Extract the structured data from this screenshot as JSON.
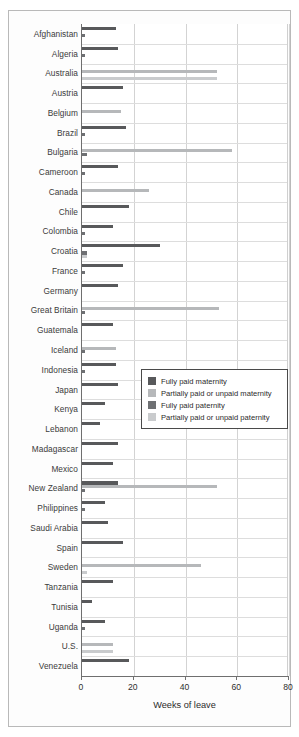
{
  "chart_data": {
    "type": "bar",
    "orientation": "horizontal",
    "title": "",
    "xlabel": "Weeks of leave",
    "ylabel": "",
    "xlim": [
      0,
      80
    ],
    "xticks": [
      0,
      20,
      40,
      60,
      80
    ],
    "xtick_labels": [
      "0",
      "20",
      "40",
      "60",
      "80"
    ],
    "grid": "vertical-and-horizontal",
    "legend_position": "center-right-inside",
    "categories": [
      "Afghanistan",
      "Algeria",
      "Australia",
      "Austria",
      "Belgium",
      "Brazil",
      "Bulgaria",
      "Cameroon",
      "Canada",
      "Chile",
      "Colombia",
      "Croatia",
      "France",
      "Germany",
      "Great Britain",
      "Guatemala",
      "Iceland",
      "Indonesia",
      "Japan",
      "Kenya",
      "Lebanon",
      "Madagascar",
      "Mexico",
      "New Zealand",
      "Philippines",
      "Saudi Arabia",
      "Spain",
      "Sweden",
      "Tanzania",
      "Tunisia",
      "Uganda",
      "U.S.",
      "Venezuela"
    ],
    "series": [
      {
        "name": "Fully paid maternity",
        "key": "fm",
        "color": "#58595b",
        "values": [
          13,
          14,
          0,
          16,
          0,
          17,
          0,
          14,
          0,
          18,
          12,
          30,
          16,
          14,
          0,
          12,
          0,
          13,
          14,
          9,
          7,
          14,
          12,
          14,
          9,
          10,
          16,
          0,
          12,
          4,
          9,
          0,
          18
        ]
      },
      {
        "name": "Partially paid or unpaid maternity",
        "key": "pm",
        "color": "#b6b8ba",
        "values": [
          0,
          0,
          52,
          0,
          15,
          0,
          58,
          0,
          26,
          0,
          0,
          0,
          0,
          0,
          53,
          0,
          13,
          0,
          0,
          0,
          0,
          0,
          0,
          52,
          0,
          0,
          0,
          46,
          0,
          0,
          0,
          12,
          0
        ]
      },
      {
        "name": "Fully paid paternity",
        "key": "fp",
        "color": "#6e7073",
        "values": [
          1,
          1,
          0,
          0,
          0,
          1,
          2,
          1,
          0,
          0,
          1,
          2,
          1,
          0,
          1,
          0,
          1,
          1,
          0,
          0,
          0,
          0,
          0,
          1,
          1,
          0,
          0,
          0,
          0,
          0,
          1,
          0,
          0
        ]
      },
      {
        "name": "Partially paid or unpaid paternity",
        "key": "pp",
        "color": "#c9cbcd",
        "values": [
          0,
          0,
          52,
          0,
          0,
          0,
          0,
          0,
          0,
          0,
          0,
          2,
          0,
          0,
          0,
          0,
          0,
          0,
          0,
          0,
          0,
          0,
          0,
          0,
          0,
          0,
          0,
          2,
          0,
          0,
          0,
          12,
          0
        ]
      }
    ]
  },
  "axis": {
    "x_title": "Weeks of leave"
  },
  "legend": {
    "items": [
      {
        "label": "Fully paid maternity",
        "color": "#58595b"
      },
      {
        "label": "Partially paid or unpaid maternity",
        "color": "#b6b8ba"
      },
      {
        "label": "Fully paid paternity",
        "color": "#6e7073"
      },
      {
        "label": "Partially paid or unpaid paternity",
        "color": "#c9cbcd"
      }
    ]
  }
}
